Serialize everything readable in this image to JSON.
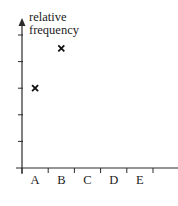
{
  "chart_data": {
    "type": "scatter",
    "title": "",
    "xlabel": "",
    "ylabel": "relative frequency",
    "ylabel_lines": [
      "relative",
      "frequency"
    ],
    "categories": [
      "A",
      "B",
      "C",
      "D",
      "E"
    ],
    "values": [
      3,
      4.5,
      null,
      null,
      null
    ],
    "marker": "x",
    "y_ticks_count": 5,
    "y_tick_labels": [],
    "ylim": [
      0,
      6
    ],
    "grid": false,
    "legend": null
  },
  "style": {
    "axis_color": "#2a2a2a",
    "marker_color": "#111111",
    "text_color": "#222222"
  }
}
